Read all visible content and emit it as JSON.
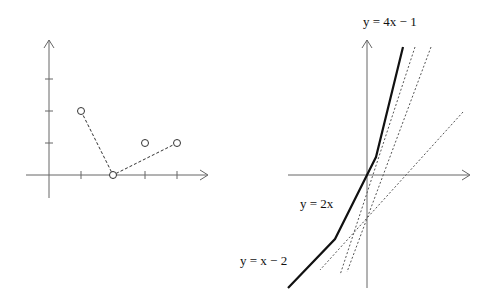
{
  "left_plot": {
    "points": [
      {
        "x": 1,
        "y": 2
      },
      {
        "x": 2,
        "y": 0
      },
      {
        "x": 3,
        "y": 1
      },
      {
        "x": 4,
        "y": 1
      }
    ],
    "dashed_path": [
      [
        1,
        2
      ],
      [
        2,
        0
      ],
      [
        4,
        1
      ]
    ],
    "x_ticks": [
      1,
      2,
      3,
      4
    ],
    "y_ticks": [
      1,
      2,
      3
    ]
  },
  "right_plot": {
    "labels": {
      "top": "y = 4x − 1",
      "middle": "y = 2x",
      "bottom": "y = x − 2"
    }
  },
  "colors": {
    "axis": "#666666",
    "curve": "#111111",
    "dotted": "#555555"
  }
}
